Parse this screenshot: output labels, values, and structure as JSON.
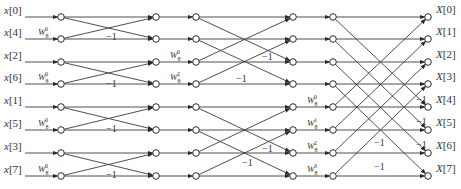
{
  "diagram": {
    "rows_y": [
      17,
      39,
      62,
      84,
      107,
      130,
      153,
      176
    ],
    "node_columns_x": [
      61,
      156,
      196,
      293,
      333,
      428
    ],
    "inputs": [
      "x[0]",
      "x[4]",
      "x[2]",
      "x[6]",
      "x[1]",
      "x[5]",
      "x[3]",
      "x[7]"
    ],
    "outputs": [
      "X[0]",
      "X[1]",
      "X[2]",
      "X[3]",
      "X[4]",
      "X[5]",
      "X[6]",
      "X[7]"
    ],
    "stages": [
      {
        "name": "stage-1",
        "span": 1,
        "twiddles": [
          {
            "row": 1,
            "base": "W",
            "sub": "8",
            "sup": "0",
            "x": 38
          },
          {
            "row": 3,
            "base": "W",
            "sub": "8",
            "sup": "0",
            "x": 38
          },
          {
            "row": 5,
            "base": "W",
            "sub": "8",
            "sup": "0",
            "x": 38
          },
          {
            "row": 7,
            "base": "W",
            "sub": "8",
            "sup": "0",
            "x": 38
          }
        ],
        "minus_one_labels": [
          {
            "text": "−1",
            "x": 106,
            "y": 40
          },
          {
            "text": "−1",
            "x": 106,
            "y": 87
          },
          {
            "text": "−1",
            "x": 106,
            "y": 132
          },
          {
            "text": "−1",
            "x": 106,
            "y": 178
          }
        ]
      },
      {
        "name": "stage-2",
        "span": 2,
        "twiddles": [
          {
            "row": 2,
            "base": "W",
            "sub": "8",
            "sup": "0",
            "x": 170
          },
          {
            "row": 3,
            "base": "W",
            "sub": "8",
            "sup": "2",
            "x": 170
          }
        ],
        "minus_one_labels": [
          {
            "text": "−1",
            "x": 262,
            "y": 60
          },
          {
            "text": "−1",
            "x": 236,
            "y": 82
          },
          {
            "text": "−1",
            "x": 262,
            "y": 152
          },
          {
            "text": "−1",
            "x": 242,
            "y": 166
          }
        ]
      },
      {
        "name": "stage-3",
        "span": 4,
        "twiddles": [
          {
            "row": 4,
            "base": "W",
            "sub": "8",
            "sup": "0",
            "x": 307
          },
          {
            "row": 5,
            "base": "W",
            "sub": "8",
            "sup": "1",
            "x": 307
          },
          {
            "row": 6,
            "base": "W",
            "sub": "8",
            "sup": "2",
            "x": 307
          },
          {
            "row": 7,
            "base": "W",
            "sub": "8",
            "sup": "3",
            "x": 307
          }
        ],
        "minus_one_labels": [
          {
            "text": "−1",
            "x": 416,
            "y": 103
          },
          {
            "text": "−1",
            "x": 416,
            "y": 125
          },
          {
            "text": "−1",
            "x": 416,
            "y": 148
          },
          {
            "text": "−1",
            "x": 374,
            "y": 146
          },
          {
            "text": "−1",
            "x": 374,
            "y": 170
          }
        ]
      }
    ],
    "colors": {
      "line": "#3a3a3a",
      "node_fill": "#ffffff",
      "text": "#333333"
    }
  }
}
